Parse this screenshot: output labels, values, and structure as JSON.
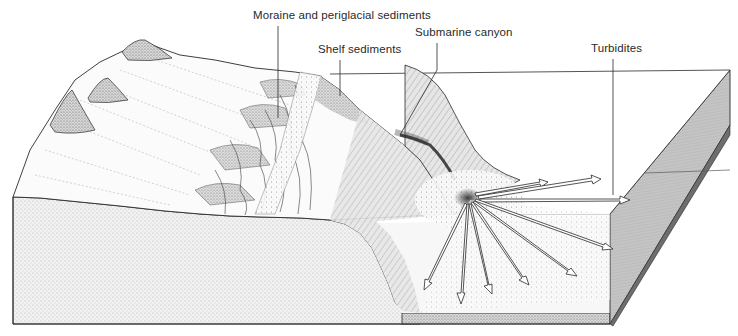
{
  "diagram": {
    "type": "block-diagram",
    "labels": {
      "moraine": "Moraine and periglacial sediments",
      "shelf": "Shelf sediments",
      "canyon": "Submarine canyon",
      "turbidites": "Turbidites"
    },
    "colors": {
      "line": "#2a2a2a",
      "background": "#ffffff",
      "stipple": "#8a8a8a",
      "side_face": "#bdbdbd"
    }
  }
}
